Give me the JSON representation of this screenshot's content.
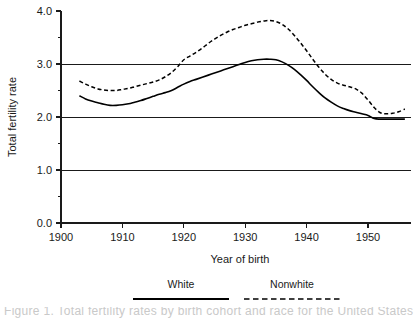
{
  "chart_data": {
    "type": "line",
    "title": "",
    "xlabel": "Year of birth",
    "ylabel": "Total fertility rate",
    "xlim": [
      1900,
      1957
    ],
    "ylim": [
      0.0,
      4.0
    ],
    "grid": "horizontal major gridlines at 1.0, 2.0, 3.0",
    "legend_position": "below-axis",
    "x_ticks": [
      1900,
      1910,
      1920,
      1930,
      1940,
      1950
    ],
    "x_tick_labels": [
      "1900",
      "1910",
      "1920",
      "1930",
      "1940",
      "1950"
    ],
    "y_ticks": [
      0.0,
      0.5,
      1.0,
      1.5,
      2.0,
      2.5,
      3.0,
      3.5,
      4.0
    ],
    "y_tick_labels": [
      "0.0",
      "",
      "1.0",
      "",
      "2.0",
      "",
      "3.0",
      "",
      "4.0"
    ],
    "y_major_labels": [
      "0.0",
      "1.0",
      "2.0",
      "3.0",
      "4.0"
    ],
    "series": [
      {
        "name": "White",
        "style": "solid",
        "color": "#000000",
        "x": [
          1903,
          1904,
          1905,
          1906,
          1907,
          1908,
          1909,
          1910,
          1911,
          1912,
          1913,
          1914,
          1915,
          1916,
          1917,
          1918,
          1919,
          1920,
          1921,
          1922,
          1923,
          1924,
          1925,
          1926,
          1927,
          1928,
          1929,
          1930,
          1931,
          1932,
          1933,
          1934,
          1935,
          1936,
          1937,
          1938,
          1939,
          1940,
          1941,
          1942,
          1943,
          1944,
          1945,
          1946,
          1947,
          1948,
          1949,
          1950,
          1951,
          1952,
          1953,
          1954,
          1955,
          1956
        ],
        "values": [
          2.4,
          2.34,
          2.3,
          2.27,
          2.24,
          2.22,
          2.22,
          2.23,
          2.25,
          2.28,
          2.31,
          2.35,
          2.39,
          2.43,
          2.46,
          2.5,
          2.56,
          2.62,
          2.67,
          2.71,
          2.75,
          2.79,
          2.83,
          2.87,
          2.91,
          2.95,
          2.99,
          3.03,
          3.06,
          3.08,
          3.09,
          3.09,
          3.08,
          3.04,
          2.98,
          2.9,
          2.8,
          2.69,
          2.57,
          2.46,
          2.36,
          2.28,
          2.21,
          2.16,
          2.12,
          2.09,
          2.06,
          2.03,
          1.97,
          1.96,
          1.96,
          1.96,
          1.96,
          1.96
        ]
      },
      {
        "name": "Nonwhite",
        "style": "dashed",
        "color": "#000000",
        "x": [
          1903,
          1904,
          1905,
          1906,
          1907,
          1908,
          1909,
          1910,
          1911,
          1912,
          1913,
          1914,
          1915,
          1916,
          1917,
          1918,
          1919,
          1920,
          1921,
          1922,
          1923,
          1924,
          1925,
          1926,
          1927,
          1928,
          1929,
          1930,
          1931,
          1932,
          1933,
          1934,
          1935,
          1936,
          1937,
          1938,
          1939,
          1940,
          1941,
          1942,
          1943,
          1944,
          1945,
          1946,
          1947,
          1948,
          1949,
          1950,
          1951,
          1952,
          1953,
          1954,
          1955,
          1956
        ],
        "values": [
          2.68,
          2.62,
          2.57,
          2.53,
          2.51,
          2.5,
          2.5,
          2.52,
          2.54,
          2.57,
          2.6,
          2.63,
          2.66,
          2.7,
          2.76,
          2.84,
          2.95,
          3.08,
          3.15,
          3.22,
          3.3,
          3.39,
          3.47,
          3.54,
          3.6,
          3.65,
          3.69,
          3.73,
          3.76,
          3.79,
          3.81,
          3.82,
          3.8,
          3.75,
          3.66,
          3.54,
          3.4,
          3.25,
          3.09,
          2.94,
          2.81,
          2.71,
          2.64,
          2.6,
          2.57,
          2.53,
          2.45,
          2.32,
          2.18,
          2.08,
          2.06,
          2.07,
          2.1,
          2.15
        ]
      }
    ],
    "legend": [
      {
        "label": "White",
        "style": "solid"
      },
      {
        "label": "Nonwhite",
        "style": "dashed"
      }
    ]
  },
  "caption": {
    "cut_off_text": "Figure 1.  Total fertility rates by birth cohort and race for the United States"
  }
}
